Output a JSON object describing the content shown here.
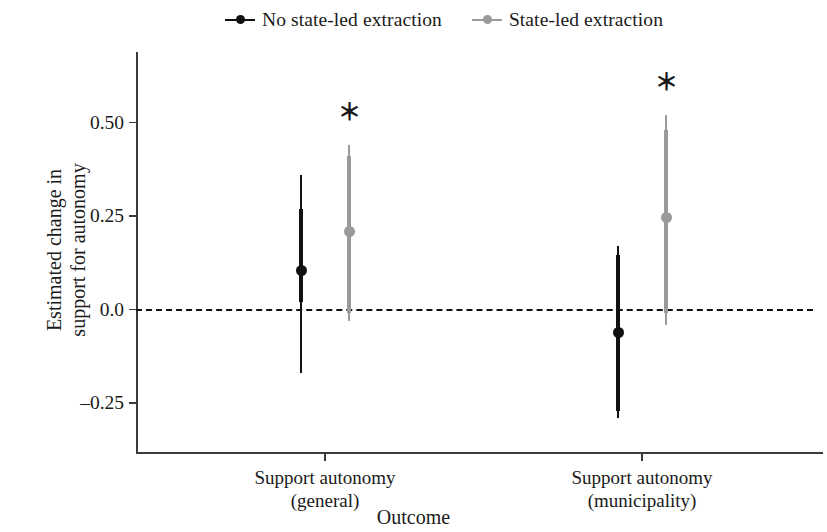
{
  "chart_data": {
    "type": "scatter",
    "subtype": "coefficient-plot-with-error-bars",
    "title": "",
    "xlabel": "Outcome",
    "ylabel": "Estimated change in support for autonomy",
    "ylabel_line1": "Estimated change in",
    "ylabel_line2": "support for autonomy",
    "categories": [
      "Support autonomy (general)",
      "Support autonomy (municipality)"
    ],
    "category_lines": [
      {
        "line1": "Support autonomy",
        "line2": "(general)"
      },
      {
        "line1": "Support autonomy",
        "line2": "(municipality)"
      }
    ],
    "ytick_labels": [
      "0.50",
      "0.25",
      "0.0",
      "–0.25"
    ],
    "ytick_values": [
      0.5,
      0.25,
      0.0,
      -0.25
    ],
    "ylim": [
      -0.33,
      0.63
    ],
    "grid": false,
    "zero_reference_line": 0.0,
    "legend_position": "top",
    "significance_marker": "＊",
    "series": [
      {
        "name": "No state-led extraction",
        "color": "#111111",
        "points": [
          {
            "category": "Support autonomy (general)",
            "estimate": 0.105,
            "ci_inner_low": 0.02,
            "ci_inner_high": 0.27,
            "ci_outer_low": -0.17,
            "ci_outer_high": 0.36,
            "significant": false
          },
          {
            "category": "Support autonomy (municipality)",
            "estimate": -0.06,
            "ci_inner_low": -0.27,
            "ci_inner_high": 0.145,
            "ci_outer_low": -0.29,
            "ci_outer_high": 0.17,
            "significant": false
          }
        ]
      },
      {
        "name": "State-led extraction",
        "color": "#9a9a9a",
        "points": [
          {
            "category": "Support autonomy (general)",
            "estimate": 0.21,
            "ci_inner_low": -0.01,
            "ci_inner_high": 0.41,
            "ci_outer_low": -0.03,
            "ci_outer_high": 0.44,
            "significant": true
          },
          {
            "category": "Support autonomy (municipality)",
            "estimate": 0.245,
            "ci_inner_low": -0.01,
            "ci_inner_high": 0.48,
            "ci_outer_low": -0.04,
            "ci_outer_high": 0.52,
            "significant": true
          }
        ]
      }
    ]
  },
  "legend": {
    "items": [
      {
        "label": "No state-led extraction",
        "color": "#111111"
      },
      {
        "label": "State-led extraction",
        "color": "#9a9a9a"
      }
    ]
  },
  "axes": {
    "y_title_line1": "Estimated change in",
    "y_title_line2": "support for autonomy",
    "x_title": "Outcome",
    "y_ticks": [
      {
        "label": "0.50",
        "value": 0.5
      },
      {
        "label": "0.25",
        "value": 0.25
      },
      {
        "label": "0.0",
        "value": 0.0
      },
      {
        "label": "–0.25",
        "value": -0.25
      }
    ],
    "x_ticks": [
      {
        "line1": "Support autonomy",
        "line2": "(general)"
      },
      {
        "line1": "Support autonomy",
        "line2": "(municipality)"
      }
    ]
  },
  "annotations": {
    "asterisk": "＊"
  }
}
